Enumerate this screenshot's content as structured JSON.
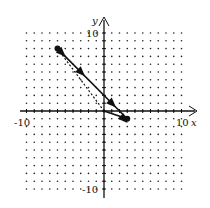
{
  "chart_data": {
    "type": "line",
    "title": "",
    "xlabel": "x",
    "ylabel": "y",
    "xlim": [
      -10,
      10
    ],
    "ylim": [
      -10,
      10
    ],
    "grid": "dotted",
    "tick_labels": {
      "x_min": "-10",
      "x_max": "10",
      "y_max": "10",
      "y_min": "-10"
    },
    "series": [
      {
        "name": "solid-line",
        "style": "solid",
        "points": [
          [
            -6,
            8
          ],
          [
            3,
            -1
          ]
        ],
        "arrows_at": [
          [
            -5.5,
            7.5
          ],
          [
            -3,
            5
          ],
          [
            1,
            1
          ],
          [
            2.5,
            -1
          ]
        ]
      },
      {
        "name": "dashed-line",
        "style": "dashed",
        "points": [
          [
            -6,
            8
          ],
          [
            0,
            0
          ]
        ]
      },
      {
        "name": "bottom-segment",
        "style": "solid",
        "points": [
          [
            0,
            0
          ],
          [
            3,
            -1
          ]
        ]
      }
    ],
    "marked_points": [
      [
        -6,
        8
      ],
      [
        3,
        -1
      ]
    ]
  }
}
